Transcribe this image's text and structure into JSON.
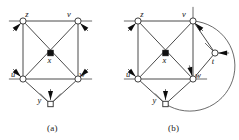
{
  "figure": {
    "width": 239,
    "height": 140,
    "background": "#ffffff",
    "edge_color": "#4a4a4a",
    "node_stroke": "#2b2b2b",
    "node_fill_open": "#ffffff",
    "node_fill_solid": "#111111",
    "arrow_color": "#0d0d0d"
  },
  "panels": [
    {
      "id": "a",
      "caption": "(a)",
      "vertices": [
        {
          "id": "z",
          "label": "z",
          "shape": "circle",
          "fill": "open",
          "x": 23,
          "y": 21,
          "label_dx": 4,
          "label_dy": -4
        },
        {
          "id": "v",
          "label": "v",
          "shape": "circle",
          "fill": "open",
          "x": 78,
          "y": 21,
          "label_dx": -9,
          "label_dy": -4
        },
        {
          "id": "x",
          "label": "x",
          "shape": "square",
          "fill": "solid",
          "x": 50.5,
          "y": 53,
          "label_dx": -1,
          "label_dy": 10
        },
        {
          "id": "u",
          "label": "u",
          "shape": "circle",
          "fill": "open",
          "x": 23,
          "y": 79,
          "label_dx": -10,
          "label_dy": -2
        },
        {
          "id": "w",
          "label": "w",
          "shape": "circle",
          "fill": "open",
          "x": 78,
          "y": 79,
          "label_dx": 4,
          "label_dy": -2
        },
        {
          "id": "y",
          "label": "y",
          "shape": "square",
          "fill": "open",
          "x": 50.5,
          "y": 104,
          "label_dx": -11,
          "label_dy": -1
        }
      ],
      "edges": [
        {
          "from": "z",
          "to": "v",
          "kind": "straight"
        },
        {
          "from": "z",
          "to": "u",
          "kind": "straight"
        },
        {
          "from": "v",
          "to": "w",
          "kind": "straight"
        },
        {
          "from": "u",
          "to": "w",
          "kind": "straight"
        },
        {
          "from": "z",
          "to": "w",
          "kind": "straight"
        },
        {
          "from": "v",
          "to": "u",
          "kind": "straight"
        },
        {
          "from": "u",
          "to": "y",
          "kind": "straight"
        },
        {
          "from": "y",
          "to": "w",
          "kind": "straight"
        }
      ],
      "half_edges": [
        {
          "at": "z",
          "angle": 225,
          "arrow": true,
          "length": 11
        },
        {
          "at": "z",
          "angle": 180,
          "arrow": false,
          "length": 11
        },
        {
          "at": "v",
          "angle": 315,
          "arrow": true,
          "length": 11
        },
        {
          "at": "v",
          "angle": 0,
          "arrow": false,
          "length": 11
        },
        {
          "at": "u",
          "angle": 135,
          "arrow": true,
          "length": 11
        },
        {
          "at": "u",
          "angle": 180,
          "arrow": false,
          "length": 11
        },
        {
          "at": "w",
          "angle": 45,
          "arrow": true,
          "length": 11
        },
        {
          "at": "w",
          "angle": 0,
          "arrow": false,
          "length": 11
        },
        {
          "at": "y",
          "angle": 90,
          "arrow": true,
          "length": 11
        },
        {
          "at": "y",
          "angle": 135,
          "arrow": false,
          "length": 11
        },
        {
          "at": "y",
          "angle": 45,
          "arrow": false,
          "length": 11
        }
      ]
    },
    {
      "id": "b",
      "caption": "(b)",
      "vertices": [
        {
          "id": "z",
          "label": "z",
          "shape": "circle",
          "fill": "open",
          "x": 138,
          "y": 21,
          "label_dx": 4,
          "label_dy": -4
        },
        {
          "id": "v",
          "label": "v",
          "shape": "circle",
          "fill": "open",
          "x": 193,
          "y": 21,
          "label_dx": -9,
          "label_dy": -4
        },
        {
          "id": "x",
          "label": "x",
          "shape": "square",
          "fill": "solid",
          "x": 165.5,
          "y": 53,
          "label_dx": -1,
          "label_dy": 10
        },
        {
          "id": "t",
          "label": "t",
          "shape": "circle",
          "fill": "open",
          "x": 215,
          "y": 53,
          "label_dx": -2,
          "label_dy": 11
        },
        {
          "id": "u",
          "label": "u",
          "shape": "circle",
          "fill": "open",
          "x": 138,
          "y": 79,
          "label_dx": -10,
          "label_dy": -2
        },
        {
          "id": "w",
          "label": "w",
          "shape": "circle",
          "fill": "open",
          "x": 193,
          "y": 79,
          "label_dx": 5,
          "label_dy": -1
        },
        {
          "id": "y",
          "label": "y",
          "shape": "square",
          "fill": "open",
          "x": 165.5,
          "y": 104,
          "label_dx": -11,
          "label_dy": -1
        }
      ],
      "edges": [
        {
          "from": "z",
          "to": "v",
          "kind": "straight"
        },
        {
          "from": "z",
          "to": "u",
          "kind": "straight"
        },
        {
          "from": "v",
          "to": "w",
          "kind": "straight"
        },
        {
          "from": "u",
          "to": "w",
          "kind": "straight"
        },
        {
          "from": "z",
          "to": "w",
          "kind": "straight"
        },
        {
          "from": "v",
          "to": "u",
          "kind": "straight"
        },
        {
          "from": "u",
          "to": "y",
          "kind": "straight"
        },
        {
          "from": "y",
          "to": "w",
          "kind": "straight"
        },
        {
          "from": "v",
          "to": "t",
          "kind": "straight"
        },
        {
          "from": "t",
          "to": "w",
          "kind": "straight"
        },
        {
          "from": "v",
          "to": "y",
          "kind": "arc",
          "sweep": 1,
          "bulge": 34
        }
      ],
      "half_edges": [
        {
          "at": "z",
          "angle": 225,
          "arrow": true,
          "length": 11
        },
        {
          "at": "z",
          "angle": 180,
          "arrow": false,
          "length": 11
        },
        {
          "at": "v",
          "angle": 315,
          "arrow": true,
          "length": 11
        },
        {
          "at": "v",
          "angle": 90,
          "arrow": false,
          "length": 11
        },
        {
          "at": "u",
          "angle": 135,
          "arrow": true,
          "length": 11
        },
        {
          "at": "u",
          "angle": 180,
          "arrow": false,
          "length": 11
        },
        {
          "at": "w",
          "angle": 105,
          "arrow": true,
          "length": 11
        },
        {
          "at": "w",
          "angle": 0,
          "arrow": false,
          "length": 11
        },
        {
          "at": "t",
          "angle": 0,
          "arrow": true,
          "length": 11
        },
        {
          "at": "t",
          "angle": 135,
          "arrow": false,
          "length": 11
        },
        {
          "at": "y",
          "angle": 90,
          "arrow": true,
          "length": 11
        },
        {
          "at": "y",
          "angle": 135,
          "arrow": false,
          "length": 11
        }
      ]
    }
  ]
}
